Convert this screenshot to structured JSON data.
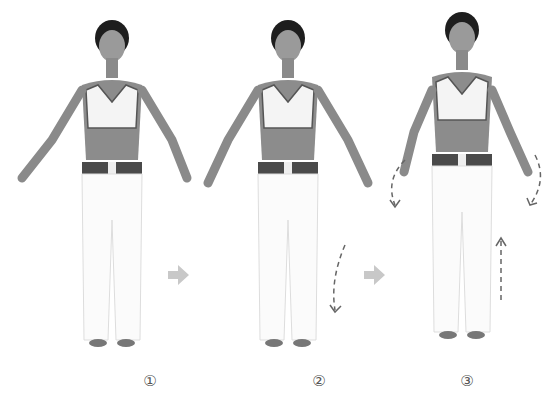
{
  "steps": [
    {
      "label": "①",
      "x": 112
    },
    {
      "label": "②",
      "x": 300
    },
    {
      "label": "③",
      "x": 464
    }
  ],
  "colors": {
    "skin": "#8a8a8a",
    "hair": "#1e1e1e",
    "top": "#f4f4f4",
    "pants": "#fbfbfb",
    "belt": "#4a4a4a",
    "arrow": "#c8c8c8",
    "dash": "#666666"
  }
}
